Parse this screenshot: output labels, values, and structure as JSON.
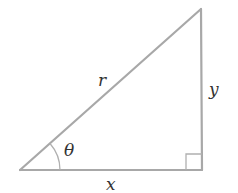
{
  "diagram": {
    "type": "right-triangle",
    "line_color": "#a8a8a8",
    "label_color": "#333333",
    "vertices": {
      "origin": [
        20,
        170
      ],
      "right_angle": [
        202,
        170
      ],
      "top": [
        201,
        9
      ]
    },
    "labels": {
      "hypotenuse": "r",
      "opposite": "y",
      "adjacent": "x",
      "angle": "θ"
    }
  }
}
